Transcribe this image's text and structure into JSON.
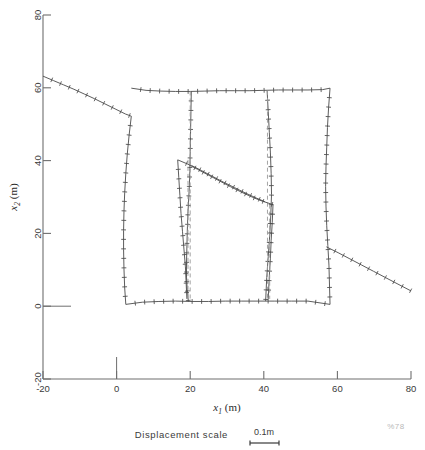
{
  "figure": {
    "kind": "deformed-finite-element-mesh",
    "background": "#ffffff",
    "line_color": "#4a4a4a",
    "dash_color": "#9a9a9a",
    "axis_color": "#6e6e6e",
    "corner_mark": "%78"
  },
  "axes": {
    "x_label_var": "x",
    "x_label_sub": "1",
    "x_label_unit": "(m)",
    "y_label_var": "x",
    "y_label_sub": "2",
    "y_label_unit": "(m)",
    "x_ticks": [
      "-20",
      "0",
      "20",
      "40",
      "60",
      "80"
    ],
    "x_tick_values": [
      -20,
      0,
      20,
      40,
      60,
      80
    ],
    "y_ticks": [
      "80",
      "60",
      "40",
      "20",
      "0",
      "-20"
    ],
    "y_tick_values": [
      80,
      60,
      40,
      20,
      0,
      -20
    ],
    "xlim": [
      -20,
      80
    ],
    "ylim": [
      -20,
      80
    ]
  },
  "legend_scale": {
    "label": "Displacement  scale",
    "value": "0.1m"
  },
  "chart_data": {
    "type": "line",
    "title": "",
    "xlabel": "x1 (m)",
    "ylabel": "x2 (m)",
    "xlim": [
      -20,
      80
    ],
    "ylim": [
      -20,
      80
    ],
    "grid": false,
    "legend": "none",
    "annotations": [
      {
        "text": "Displacement  scale",
        "x": 24,
        "y": -31
      },
      {
        "text": "0.1m",
        "x": 46,
        "y": -29
      },
      {
        "text": "%78",
        "x": 75,
        "y": -31
      }
    ],
    "series": [
      {
        "name": "ground-surface-left",
        "style": "solid-with-ticks",
        "x": [
          -20.0,
          -17.2,
          -14.4,
          -11.6,
          -8.8,
          -6.0,
          -3.2,
          -0.4,
          2.4,
          4.0
        ],
        "y": [
          63.2,
          62.0,
          60.8,
          59.6,
          58.3,
          57.0,
          55.6,
          54.2,
          52.8,
          52.2
        ]
      },
      {
        "name": "block-left-edge",
        "style": "solid-with-ticks",
        "x": [
          4.0,
          3.4,
          2.9,
          2.5,
          2.2,
          2.0,
          1.9,
          1.9,
          2.0,
          2.2,
          2.5
        ],
        "y": [
          52.2,
          47.0,
          41.8,
          36.5,
          31.2,
          26.0,
          20.8,
          15.5,
          10.3,
          5.0,
          0.5
        ]
      },
      {
        "name": "block-top-edge",
        "style": "solid-with-ticks",
        "x": [
          4.0,
          8.0,
          12.0,
          16.0,
          20.0,
          24.0,
          28.0,
          32.0,
          36.0,
          40.0,
          44.0,
          48.0,
          52.0,
          56.0,
          58.0
        ],
        "y": [
          59.9,
          59.3,
          59.1,
          59.0,
          59.0,
          59.1,
          59.2,
          59.2,
          59.2,
          59.3,
          59.4,
          59.4,
          59.4,
          59.5,
          59.9
        ]
      },
      {
        "name": "block-right-edge",
        "style": "solid-with-ticks",
        "x": [
          58.0,
          57.6,
          57.3,
          57.1,
          56.9,
          56.8,
          56.9,
          57.1,
          57.4,
          57.7,
          58.0
        ],
        "y": [
          59.9,
          54.5,
          49.1,
          43.7,
          38.3,
          32.9,
          27.5,
          22.1,
          16.7,
          11.3,
          0.5
        ]
      },
      {
        "name": "block-bottom-edge",
        "style": "solid-with-ticks",
        "x": [
          2.5,
          7.0,
          11.5,
          16.0,
          20.5,
          25.0,
          29.5,
          34.0,
          38.5,
          43.0,
          47.5,
          52.0,
          58.0
        ],
        "y": [
          0.5,
          1.1,
          1.3,
          1.4,
          1.3,
          1.3,
          1.4,
          1.4,
          1.4,
          1.4,
          1.4,
          1.4,
          0.5
        ]
      },
      {
        "name": "ground-surface-right",
        "style": "solid-with-ticks",
        "x": [
          57.0,
          60.2,
          63.4,
          66.6,
          69.8,
          73.0,
          76.2,
          80.0
        ],
        "y": [
          16.3,
          14.7,
          13.0,
          11.3,
          9.6,
          7.9,
          6.2,
          4.2
        ]
      },
      {
        "name": "fault-left-branch-deformed",
        "style": "solid-with-ticks",
        "x": [
          20.3,
          20.2,
          20.1,
          20.0,
          19.9,
          19.7,
          19.4,
          19.2,
          19.0
        ],
        "y": [
          59.0,
          53.5,
          48.0,
          42.5,
          37.0,
          31.5,
          26.0,
          20.5,
          12.0
        ]
      },
      {
        "name": "fault-left-branch-lower-deformed",
        "style": "solid-with-ticks",
        "x": [
          19.0,
          19.0,
          19.2,
          19.5
        ],
        "y": [
          12.0,
          8.0,
          4.5,
          1.3
        ]
      },
      {
        "name": "fault-left-reference",
        "style": "dashed",
        "x": [
          20.0,
          20.0
        ],
        "y": [
          59.0,
          1.3
        ]
      },
      {
        "name": "fault-right-branch-deformed",
        "style": "solid-with-ticks",
        "x": [
          40.9,
          41.2,
          41.5,
          41.8,
          42.0,
          42.1,
          41.9,
          41.6,
          41.2,
          40.8,
          40.5
        ],
        "y": [
          59.2,
          53.5,
          47.8,
          42.1,
          36.4,
          30.7,
          25.0,
          19.3,
          13.6,
          7.9,
          1.4
        ]
      },
      {
        "name": "fault-right-reference",
        "style": "dashed",
        "x": [
          41.0,
          41.0
        ],
        "y": [
          59.2,
          1.4
        ]
      },
      {
        "name": "inner-wedge-left-deformed",
        "style": "solid-with-ticks",
        "x": [
          16.6,
          16.9,
          17.2,
          17.5,
          17.9,
          18.3,
          18.7,
          19.1
        ],
        "y": [
          40.2,
          35.3,
          30.4,
          25.5,
          20.6,
          15.7,
          10.8,
          2.0
        ]
      },
      {
        "name": "inner-wedge-left-reference",
        "style": "dashed",
        "x": [
          19.4,
          19.4
        ],
        "y": [
          40.2,
          2.0
        ]
      },
      {
        "name": "shear-band-upper",
        "style": "solid-with-ticks",
        "x": [
          16.6,
          19.2,
          22.0,
          25.0,
          28.0,
          31.0,
          34.0,
          37.0,
          39.5,
          42.5
        ],
        "y": [
          40.2,
          39.1,
          37.6,
          36.0,
          34.4,
          32.8,
          31.3,
          29.9,
          28.9,
          27.9
        ]
      },
      {
        "name": "shear-band-lower",
        "style": "solid-with-ticks",
        "x": [
          20.3,
          23.0,
          26.0,
          29.0,
          32.0,
          35.0,
          38.0,
          40.3
        ],
        "y": [
          38.7,
          37.3,
          35.7,
          34.1,
          32.6,
          31.1,
          29.7,
          28.7
        ]
      },
      {
        "name": "inner-wedge-right-deformed",
        "style": "solid-with-ticks",
        "x": [
          42.5,
          42.3,
          42.0,
          41.8,
          41.5,
          41.2
        ],
        "y": [
          27.9,
          23.0,
          18.1,
          13.2,
          8.3,
          2.0
        ]
      },
      {
        "name": "inner-wedge-right-reference",
        "style": "dashed",
        "x": [
          41.6,
          41.6
        ],
        "y": [
          27.9,
          2.0
        ]
      }
    ]
  }
}
